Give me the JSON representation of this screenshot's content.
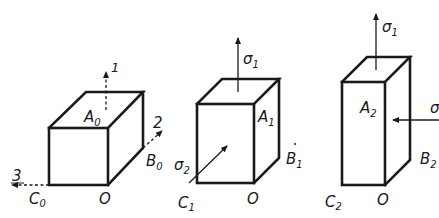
{
  "figure": {
    "colors": {
      "ink": "#1a1a1a",
      "background": "#ffffff"
    }
  },
  "blocks": [
    {
      "id": "initial",
      "labels": {
        "top": {
          "base": "A",
          "sub": "0"
        },
        "right": {
          "base": "B",
          "sub": "0"
        },
        "left": {
          "base": "C",
          "sub": "0"
        },
        "origin": "O"
      },
      "axes": [
        {
          "label": "1",
          "direction": "up",
          "style": "dashed"
        },
        {
          "label": "2",
          "direction": "back-right",
          "style": "dashed"
        },
        {
          "label": "3",
          "direction": "left",
          "style": "dashed"
        }
      ]
    },
    {
      "id": "stage-1",
      "labels": {
        "top": {
          "base": "A",
          "sub": "1"
        },
        "right": {
          "base": "B",
          "sub": "1"
        },
        "left": {
          "base": "C",
          "sub": "1"
        },
        "origin": "O"
      },
      "stresses": [
        {
          "label": {
            "base": "σ",
            "sub": "1"
          },
          "direction": "up"
        },
        {
          "label": {
            "base": "σ",
            "sub": "2"
          },
          "direction": "into-front-face"
        }
      ]
    },
    {
      "id": "stage-2",
      "labels": {
        "top": {
          "base": "A",
          "sub": "2"
        },
        "right": {
          "base": "B",
          "sub": "2"
        },
        "left": {
          "base": "C",
          "sub": "2"
        },
        "origin": "O"
      },
      "stresses": [
        {
          "label": {
            "base": "σ",
            "sub": "1"
          },
          "direction": "up"
        },
        {
          "label": {
            "base": "σ",
            "sub": ""
          },
          "direction": "left (into right face)",
          "note": "label cut off at image edge"
        }
      ]
    }
  ]
}
